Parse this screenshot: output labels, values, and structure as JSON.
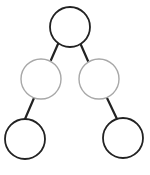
{
  "diagram": {
    "type": "binary-tree",
    "colors": {
      "background": "#ffffff",
      "dark_stroke": "#222222",
      "light_stroke": "#a8a8a8",
      "edge": "#222222"
    },
    "nodes": [
      {
        "id": "root",
        "cx": 70,
        "cy": 27,
        "r": 20,
        "style": "dark",
        "label": ""
      },
      {
        "id": "mid-left",
        "cx": 41,
        "cy": 79,
        "r": 20,
        "style": "light",
        "label": ""
      },
      {
        "id": "mid-right",
        "cx": 99,
        "cy": 79,
        "r": 20,
        "style": "light",
        "label": ""
      },
      {
        "id": "leaf-left",
        "cx": 25,
        "cy": 139,
        "r": 20,
        "style": "dark",
        "label": ""
      },
      {
        "id": "leaf-right",
        "cx": 123,
        "cy": 138,
        "r": 20,
        "style": "dark",
        "label": ""
      }
    ],
    "edges": [
      {
        "from": "root",
        "to": "mid-left",
        "x1": 58,
        "y1": 44,
        "x2": 51,
        "y2": 60
      },
      {
        "from": "root",
        "to": "mid-right",
        "x1": 81,
        "y1": 45,
        "x2": 88,
        "y2": 61
      },
      {
        "from": "mid-left",
        "to": "leaf-left",
        "x1": 34,
        "y1": 98,
        "x2": 25,
        "y2": 119
      },
      {
        "from": "mid-right",
        "to": "leaf-right",
        "x1": 107,
        "y1": 98,
        "x2": 117,
        "y2": 119
      }
    ]
  }
}
